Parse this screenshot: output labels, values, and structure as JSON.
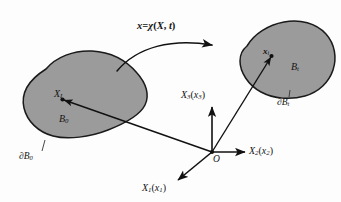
{
  "figure": {
    "background_color": "#fdfdfd",
    "body_fill_color": "#9b9b9b",
    "body_stroke_color": "#1a1a1a",
    "line_color": "#111111"
  },
  "mapping": {
    "label_x": "x",
    "label_equals": "=",
    "label_chi": "χ",
    "label_open": "(",
    "label_X": "X",
    "label_comma": ",",
    "label_t": "t",
    "label_close": ")",
    "full_text": "x=χ(X, t)",
    "arrow_name": "deformation-map-arrow"
  },
  "reference_body": {
    "point_label": "X",
    "point_subscript": "I",
    "body_label": "B",
    "body_subscript": "0",
    "boundary_label": "∂B",
    "boundary_subscript": "0"
  },
  "current_body": {
    "point_label": "x",
    "point_subscript": "i",
    "body_label": "B",
    "body_subscript": "t",
    "boundary_label": "∂B",
    "boundary_subscript": "t"
  },
  "axes": {
    "origin_label": "O",
    "axis_1": {
      "major": "X",
      "major_sub": "1",
      "minor": "x",
      "minor_sub": "1",
      "text": "X₁(x₁)"
    },
    "axis_2": {
      "major": "X",
      "major_sub": "2",
      "minor": "x",
      "minor_sub": "2",
      "text": "X₂(x₂)"
    },
    "axis_3": {
      "major": "X",
      "major_sub": "3",
      "minor": "x",
      "minor_sub": "3",
      "text": "X₃(x₃)"
    }
  }
}
